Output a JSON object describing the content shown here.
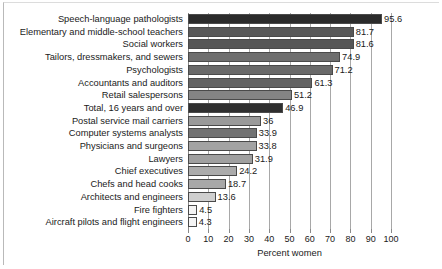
{
  "chart_data": {
    "type": "bar",
    "orientation": "horizontal",
    "title": "",
    "xlabel": "Percent women",
    "ylabel": "",
    "xlim": [
      0,
      100
    ],
    "xticks": [
      0,
      10,
      20,
      30,
      40,
      50,
      60,
      70,
      80,
      90,
      100
    ],
    "grid": true,
    "legend": "none",
    "categories": [
      "Speech-language pathologists",
      "Elementary and middle-school teachers",
      "Social workers",
      "Tailors, dressmakers, and sewers",
      "Psychologists",
      "Accountants and auditors",
      "Retail salespersons",
      "Total, 16 years and over",
      "Postal service mail carriers",
      "Computer systems analysts",
      "Physicians and surgeons",
      "Lawyers",
      "Chief executives",
      "Chefs and head cooks",
      "Architects and engineers",
      "Fire fighters",
      "Aircraft pilots and flight engineers"
    ],
    "values": [
      95.6,
      81.7,
      81.6,
      74.9,
      71.2,
      61.3,
      51.2,
      46.9,
      36,
      33.9,
      33.8,
      31.9,
      24.2,
      18.7,
      13.6,
      4.5,
      4.3
    ],
    "value_labels": [
      "95.6",
      "81.7",
      "81.6",
      "74.9",
      "71.2",
      "61.3",
      "51.2",
      "46.9",
      "36",
      "33.9",
      "33.8",
      "31.9",
      "24.2",
      "18.7",
      "13.6",
      "4.5",
      "4.3"
    ],
    "bar_colors": [
      "#2b2b2b",
      "#585858",
      "#565656",
      "#6e6e6e",
      "#696969",
      "#636363",
      "#848484",
      "#2f2f2f",
      "#9a9a9a",
      "#727272",
      "#a3a3a3",
      "#a0a0a0",
      "#ababab",
      "#a8a8a8",
      "#cfcfcf",
      "#f4f4f4",
      "#f4f4f4"
    ]
  }
}
